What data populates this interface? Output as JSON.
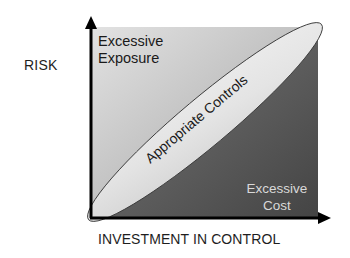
{
  "diagram": {
    "title": "",
    "y_axis": {
      "label": "RISK"
    },
    "x_axis": {
      "label": "INVESTMENT IN CONTROL"
    },
    "zones": {
      "upper_left": {
        "line1": "Excessive",
        "line2": "Exposure"
      },
      "diagonal": {
        "label": "Appropriate Controls"
      },
      "lower_right": {
        "line1": "Excessive",
        "line2": "Cost"
      }
    },
    "colors": {
      "upper_left_light": "#dcdcdc",
      "upper_left_dark": "#9e9e9e",
      "lower_right_light": "#6e6e6e",
      "lower_right_dark": "#484848",
      "ellipse_fill": "#dedede",
      "ellipse_stroke": "#3a3a3a",
      "axis": "#000000",
      "cost_text": "#d9d9d9"
    }
  }
}
